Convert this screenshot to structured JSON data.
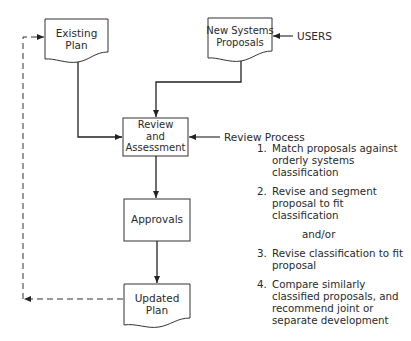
{
  "diagram": {
    "nodes": {
      "existing_plan": {
        "line1": "Existing",
        "line2": "Plan",
        "shape": "document"
      },
      "new_proposals": {
        "line1": "New Systems",
        "line2": "Proposals",
        "shape": "document"
      },
      "review": {
        "line1": "Review",
        "line2": "and",
        "line3": "Assessment",
        "shape": "process"
      },
      "approvals": {
        "line1": "Approvals",
        "shape": "process"
      },
      "updated_plan": {
        "line1": "Updated",
        "line2": "Plan",
        "shape": "document"
      }
    },
    "inputs": {
      "users": "USERS",
      "review_process": "Review Process"
    },
    "review_steps": [
      {
        "num": "1.",
        "text": "Match proposals against orderly systems classification"
      },
      {
        "num": "2.",
        "text": "Revise and segment proposal to fit classification"
      },
      {
        "num": "3.",
        "text": "Revise classification to fit proposal"
      },
      {
        "num": "4.",
        "text": "Compare similarly classified proposals, and recommend joint or separate development"
      }
    ],
    "connector_text": "and/or",
    "edges": [
      {
        "from": "existing_plan",
        "to": "review",
        "style": "solid"
      },
      {
        "from": "new_proposals",
        "to": "review",
        "style": "solid"
      },
      {
        "from": "users",
        "to": "new_proposals",
        "style": "solid"
      },
      {
        "from": "review_process",
        "to": "review",
        "style": "solid"
      },
      {
        "from": "review",
        "to": "approvals",
        "style": "solid"
      },
      {
        "from": "approvals",
        "to": "updated_plan",
        "style": "solid"
      },
      {
        "from": "updated_plan",
        "to": "existing_plan",
        "style": "dashed"
      }
    ]
  }
}
